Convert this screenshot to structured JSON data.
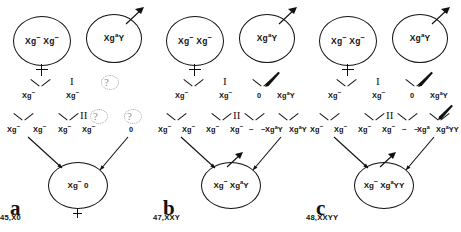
{
  "figure": {
    "symbols": {
      "meiosis_one": "I",
      "meiosis_two": "II",
      "unknown": "?",
      "dash": "–",
      "female_symbol": "female-cross"
    }
  },
  "panels": [
    {
      "id": "a",
      "letter": "a",
      "karyotype": "45,X0",
      "maternal_parent": {
        "label_html": "Xg<span class='minus'>−</span> Xg<span class='minus'>−</span>",
        "sex": "female"
      },
      "paternal_parent": {
        "label_html": "Xg<sup>a</sup>Y",
        "sex": "male",
        "nondisjunction": true
      },
      "meiosis_I_products": [
        {
          "text_html": "Xg<span class='minus'>−</span>",
          "x": 22
        },
        {
          "text_html": "Xg<span class='minus'>−</span>",
          "x": 66
        },
        {
          "text_html": "",
          "x": 103
        },
        {
          "text_html": "",
          "x": 128
        }
      ],
      "meiosis_II_products": [
        {
          "text_html": "Xg<span class='minus'>−</span>",
          "x": 7
        },
        {
          "text_html": "Xg<span class='minus'>−</span>",
          "x": 33
        },
        {
          "text_html": "Xg<span class='minus'>−</span>",
          "x": 58
        },
        {
          "text_html": "Xg<span class='minus'>−</span>",
          "x": 82
        },
        {
          "text_html": "0",
          "x": 129
        }
      ],
      "zygote": {
        "label_html": "Xg<span class='minus'>−</span> 0"
      },
      "nondisjunction_stage": "paternal, both meiosis I and II (Y and Xg-a lost)"
    },
    {
      "id": "b",
      "letter": "b",
      "karyotype": "47,XXY",
      "maternal_parent": {
        "label_html": "Xg<span class='minus'>−</span> Xg<span class='minus'>−</span>",
        "sex": "female"
      },
      "paternal_parent": {
        "label_html": "Xg<sup>a</sup>Y",
        "sex": "male",
        "nondisjunction": true
      },
      "meiosis_I_products": [
        {
          "text_html": "Xg<span class='minus'>−</span>",
          "x": 22
        },
        {
          "text_html": "Xg<span class='minus'>−</span>",
          "x": 66
        },
        {
          "text_html": "0",
          "x": 104
        },
        {
          "text_html": "Xg<sup>a</sup>Y",
          "x": 124
        }
      ],
      "meiosis_II_products": [
        {
          "text_html": "Xg<span class='minus'>−</span>",
          "x": 5
        },
        {
          "text_html": "Xg<span class='minus'>−</span>",
          "x": 29
        },
        {
          "text_html": "Xg<span class='minus'>−</span>",
          "x": 53
        },
        {
          "text_html": "Xg<span class='minus'>−</span>",
          "x": 77
        },
        {
          "text_html": "Xg<sup>a</sup>Y",
          "x": 112
        },
        {
          "text_html": "Xg<sup>a</sup>Y",
          "x": 136
        }
      ],
      "zygote": {
        "label_html": "Xg<span class='minus'>−</span> Xg<sup>a</sup>Y"
      },
      "nondisjunction_stage": "paternal meiosis I"
    },
    {
      "id": "c",
      "letter": "c",
      "karyotype": "48,XXYY",
      "maternal_parent": {
        "label_html": "Xg<span class='minus'>−</span> Xg<span class='minus'>−</span>",
        "sex": "female"
      },
      "paternal_parent": {
        "label_html": "Xg<sup>a</sup>Y",
        "sex": "male",
        "nondisjunction": true
      },
      "meiosis_I_products": [
        {
          "text_html": "Xg<span class='minus'>−</span>",
          "x": 22
        },
        {
          "text_html": "Xg<span class='minus'>−</span>",
          "x": 66
        },
        {
          "text_html": "0",
          "x": 104
        },
        {
          "text_html": "Xg<sup>a</sup>Y",
          "x": 124
        }
      ],
      "meiosis_II_products": [
        {
          "text_html": "Xg<span class='minus'>−</span>",
          "x": 4
        },
        {
          "text_html": "Xg<span class='minus'>−</span>",
          "x": 28
        },
        {
          "text_html": "Xg<span class='minus'>−</span>",
          "x": 52
        },
        {
          "text_html": "Xg<span class='minus'>−</span>",
          "x": 76
        },
        {
          "text_html": "Xg<sup>a</sup>",
          "x": 111
        },
        {
          "text_html": "Xg<sup>a</sup>YY",
          "x": 130
        }
      ],
      "zygote": {
        "label_html": "Xg<span class='minus'>−</span> Xg<sup>a</sup>YY"
      },
      "nondisjunction_stage": "paternal meiosis I and meiosis II"
    }
  ],
  "colors": {
    "ink": "#111111",
    "faint": "#8c8c8c",
    "background": "#ffffff"
  }
}
